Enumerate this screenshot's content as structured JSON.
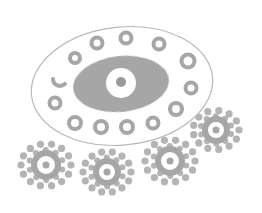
{
  "image": {
    "description": "Grayscale line drawing of an eye-like oval surrounded by small rings, with four gear-like dotted circles below",
    "width": 262,
    "height": 213,
    "colors": {
      "background": "#ffffff",
      "outline": "#b8b8b8",
      "fill_dark": "#9a9a9a",
      "fill_mid": "#a6a6a6",
      "dots": "#b4b4b4"
    }
  },
  "outer_oval": {
    "cx": 122,
    "cy": 86,
    "rx": 91,
    "ry": 59,
    "rotate": -6
  },
  "eye": {
    "iris": {
      "cx": 121,
      "cy": 84,
      "rx": 48,
      "ry": 28,
      "rotate": -6
    },
    "pupil_white": {
      "cx": 121,
      "cy": 83,
      "r": 15
    },
    "pupil_dot": {
      "cx": 121,
      "cy": 82,
      "r": 5
    }
  },
  "rings": [
    {
      "cx": 97,
      "cy": 43,
      "r": 7.5
    },
    {
      "cx": 126,
      "cy": 38,
      "r": 7.5
    },
    {
      "cx": 159,
      "cy": 44,
      "r": 7.5
    },
    {
      "cx": 188,
      "cy": 61,
      "r": 8.5
    },
    {
      "cx": 191,
      "cy": 88,
      "r": 7.5
    },
    {
      "cx": 176,
      "cy": 109,
      "r": 8
    },
    {
      "cx": 153,
      "cy": 123,
      "r": 7.5
    },
    {
      "cx": 127,
      "cy": 127,
      "r": 8
    },
    {
      "cx": 101,
      "cy": 127,
      "r": 8
    },
    {
      "cx": 75,
      "cy": 123,
      "r": 8
    },
    {
      "cx": 55,
      "cy": 103,
      "r": 7.5
    },
    {
      "cx": 60,
      "cy": 79,
      "r": 7,
      "partial": true
    },
    {
      "cx": 75,
      "cy": 58,
      "r": 7
    }
  ],
  "gears": [
    {
      "cx": 46,
      "cy": 165,
      "inner_r": 12,
      "ring_r": 25,
      "dots": 14
    },
    {
      "cx": 107,
      "cy": 172,
      "inner_r": 11,
      "ring_r": 24,
      "dots": 14
    },
    {
      "cx": 170,
      "cy": 161,
      "inner_r": 12,
      "ring_r": 25,
      "dots": 14
    },
    {
      "cx": 216,
      "cy": 130,
      "inner_r": 11,
      "ring_r": 23,
      "dots": 13
    }
  ]
}
